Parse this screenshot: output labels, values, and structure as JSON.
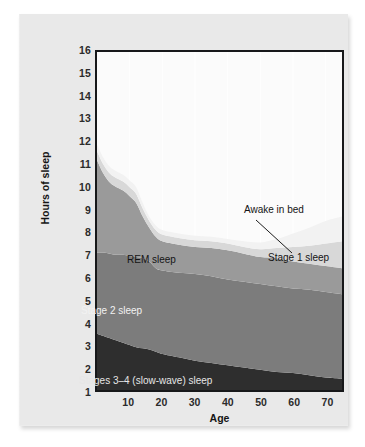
{
  "figure": {
    "background_color": "#e9e9e9",
    "plot_background_color": "#fbfbfb",
    "frame_color": "#17181a"
  },
  "axes": {
    "y_title": "Hours of sleep",
    "x_title": "Age",
    "y_ticks": [
      "16",
      "15",
      "14",
      "13",
      "12",
      "11",
      "10",
      "9",
      "8",
      "7",
      "6",
      "5",
      "4",
      "3",
      "2",
      "1"
    ],
    "x_ticks": [
      "10",
      "20",
      "30",
      "40",
      "50",
      "60",
      "70"
    ]
  },
  "annotations": {
    "awake_in_bed": "Awake in bed",
    "stage1_sleep": "Stage 1 sleep",
    "rem_sleep": "REM sleep",
    "stage2_sleep": "Stage 2 sleep",
    "stages34_sleep": "Stages 3–4 (slow-wave) sleep"
  },
  "chart_data": {
    "type": "area",
    "title": "",
    "subtitle": "",
    "xlabel": "Age",
    "ylabel": "Hours of sleep",
    "xlim": [
      0,
      75
    ],
    "ylim": [
      1,
      16
    ],
    "grid": "vertical-only",
    "legend": "in-plot labels",
    "stacked": true,
    "stack_order_bottom_to_top": [
      "Stages 3-4 (slow-wave) sleep",
      "Stage 2 sleep",
      "REM sleep",
      "Stage 1 sleep",
      "Awake in bed"
    ],
    "colors": {
      "Awake in bed": "#f2f2f2",
      "Stage 1 sleep": "#d8d8d8",
      "REM sleep": "#9a9a9a",
      "Stage 2 sleep": "#7c7c7c",
      "Stages 3-4 (slow-wave) sleep": "#2e2e2e"
    },
    "x": [
      0,
      2,
      4,
      6,
      8,
      10,
      12,
      14,
      16,
      18,
      20,
      25,
      30,
      35,
      40,
      45,
      50,
      55,
      60,
      65,
      70,
      75
    ],
    "cumulative_upper_boundaries_hours": {
      "stages34_top": [
        3.5,
        3.4,
        3.3,
        3.2,
        3.1,
        3.0,
        2.9,
        2.85,
        2.8,
        2.7,
        2.6,
        2.45,
        2.3,
        2.2,
        2.1,
        2.0,
        1.9,
        1.8,
        1.75,
        1.65,
        1.55,
        1.5
      ],
      "stage2_top": [
        7.1,
        7.1,
        7.05,
        7.0,
        7.0,
        6.95,
        6.9,
        6.85,
        6.7,
        6.4,
        6.3,
        6.2,
        6.15,
        6.05,
        5.9,
        5.8,
        5.7,
        5.6,
        5.5,
        5.45,
        5.35,
        5.25
      ],
      "rem_top": [
        11.2,
        10.6,
        10.2,
        10.0,
        9.85,
        9.6,
        9.3,
        8.7,
        8.2,
        7.8,
        7.6,
        7.45,
        7.35,
        7.3,
        7.2,
        7.05,
        6.9,
        6.85,
        6.7,
        6.6,
        6.5,
        6.4
      ],
      "stage1_top": [
        11.6,
        11.0,
        10.6,
        10.4,
        10.25,
        10.0,
        9.7,
        9.05,
        8.5,
        8.1,
        7.9,
        7.75,
        7.65,
        7.6,
        7.5,
        7.35,
        7.25,
        7.3,
        7.35,
        7.4,
        7.5,
        7.6
      ],
      "awake_top": [
        11.9,
        11.3,
        10.9,
        10.7,
        10.55,
        10.3,
        10.0,
        9.3,
        8.7,
        8.3,
        8.1,
        7.95,
        7.85,
        7.8,
        7.7,
        7.6,
        7.55,
        7.7,
        7.95,
        8.2,
        8.5,
        8.7
      ]
    }
  }
}
